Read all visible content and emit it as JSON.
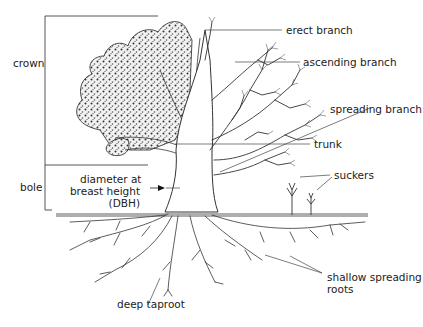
{
  "diagram": {
    "colors": {
      "line": "#222222",
      "background": "#ffffff",
      "leaf_fill": "#e8e8e8"
    },
    "labels": {
      "crown": "crown",
      "bole": "bole",
      "dbh_line1": "diameter at",
      "dbh_line2": "breast height",
      "dbh_line3": "(DBH)",
      "erect_branch": "erect branch",
      "ascending_branch": "ascending branch",
      "spreading_branch": "spreading branch",
      "trunk": "trunk",
      "suckers": "suckers",
      "deep_taproot": "deep taproot",
      "shallow_roots_line1": "shallow spreading",
      "shallow_roots_line2": "roots"
    }
  }
}
